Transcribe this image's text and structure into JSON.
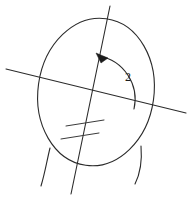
{
  "figure": {
    "background_color": "#ffffff",
    "stroke_color": "#2b2b2b",
    "label_color": "#1c1c1c",
    "width": 188,
    "height": 197,
    "angle_label": "2",
    "angle_label_position": {
      "x": 128,
      "y": 81
    },
    "elements": {
      "head_outline": {
        "name": "head-oval",
        "cx": 96,
        "cy": 92,
        "rx": 58,
        "ry": 74,
        "rotation_deg": 8
      },
      "steep_line": {
        "name": "steep-line",
        "x1": 110,
        "y1": 6,
        "x2": 71,
        "y2": 194
      },
      "shallow_line": {
        "name": "shallow-line",
        "x1": 6,
        "y1": 69,
        "x2": 186,
        "y2": 113
      },
      "angle_arc": {
        "name": "angle-arc",
        "center_x": 92,
        "center_y": 97,
        "radius": 44,
        "start_x": 135,
        "start_y": 107,
        "end_x": 99,
        "end_y": 55
      },
      "arrowhead": {
        "name": "arc-arrowhead",
        "tip_x": 97,
        "tip_y": 55,
        "points": "97,54 107,59 101,62"
      },
      "tick_marks": [
        {
          "name": "tick-mark-upper",
          "x1": 66,
          "y1": 126,
          "x2": 104,
          "y2": 120
        },
        {
          "name": "tick-mark-lower",
          "x1": 61,
          "y1": 139,
          "x2": 99,
          "y2": 133
        }
      ],
      "neck_curves": [
        {
          "name": "neck-curve-left",
          "path": "M 50 148 C 47 160 45 173 41 186"
        },
        {
          "name": "neck-curve-right",
          "path": "M 141 146 C 142 158 141 172 135 184"
        }
      ]
    }
  }
}
